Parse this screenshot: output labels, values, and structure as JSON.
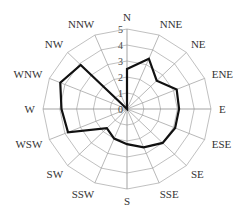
{
  "chart_data": {
    "type": "radar",
    "title": "",
    "categories": [
      "N",
      "NNE",
      "NE",
      "ENE",
      "E",
      "ESE",
      "SE",
      "SSE",
      "S",
      "SSW",
      "SW",
      "WSW",
      "W",
      "WNW",
      "NW",
      "NNW"
    ],
    "series": [
      {
        "name": "frequency",
        "values": [
          2.5,
          3.4,
          2.5,
          3.2,
          3.1,
          3.1,
          3.0,
          2.6,
          2.2,
          2.0,
          1.7,
          3.8,
          3.9,
          4.3,
          3.9,
          0
        ]
      }
    ],
    "rlim": [
      0,
      5
    ],
    "rticks": [
      "0",
      "1",
      "2",
      "3",
      "4",
      "5"
    ],
    "grid": true,
    "legend": "none",
    "colors": {
      "series": "#111111",
      "grid": "#b0b0b0",
      "axis": "#999999",
      "text": "#333333"
    }
  }
}
